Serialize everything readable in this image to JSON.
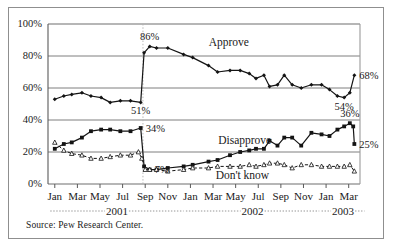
{
  "figure": {
    "source_note": "Source: Pew Research Center."
  },
  "chart_data": {
    "type": "line",
    "title": "",
    "xlabel": "",
    "ylabel": "",
    "ylim": [
      0,
      100
    ],
    "grid": true,
    "legend_position": "inline-annotations",
    "ytick_labels": [
      "0%",
      "20%",
      "40%",
      "60%",
      "80%",
      "100%"
    ],
    "ytick_values": [
      0,
      20,
      40,
      60,
      80,
      100
    ],
    "xtick_labels": [
      "Jan",
      "Mar",
      "May",
      "Jul",
      "Sep",
      "Nov",
      "Jan",
      "Mar",
      "May",
      "Jul",
      "Sep",
      "Nov",
      "Jan",
      "Mar"
    ],
    "xtick_positions": [
      0,
      2,
      4,
      6,
      8,
      10,
      12,
      14,
      16,
      18,
      20,
      22,
      24,
      26
    ],
    "year_groups": [
      {
        "label": "2001",
        "start": 0,
        "end": 11
      },
      {
        "label": "2002",
        "start": 12,
        "end": 23
      },
      {
        "label": "2003",
        "start": 24,
        "end": 27
      }
    ],
    "event_marker": {
      "label": "",
      "x": 8.4,
      "style": "dotted-vertical"
    },
    "series": [
      {
        "name": "Approve",
        "marker": "filled-diamond",
        "line_style": "solid",
        "color": "#141414",
        "points": [
          {
            "x": 0.6,
            "y": 53
          },
          {
            "x": 1.4,
            "y": 55
          },
          {
            "x": 2.1,
            "y": 56
          },
          {
            "x": 3.0,
            "y": 57
          },
          {
            "x": 3.8,
            "y": 55
          },
          {
            "x": 4.7,
            "y": 54
          },
          {
            "x": 5.5,
            "y": 51
          },
          {
            "x": 6.4,
            "y": 52
          },
          {
            "x": 7.3,
            "y": 52
          },
          {
            "x": 8.2,
            "y": 51
          },
          {
            "x": 8.5,
            "y": 82
          },
          {
            "x": 9.0,
            "y": 86
          },
          {
            "x": 9.6,
            "y": 85
          },
          {
            "x": 10.6,
            "y": 85
          },
          {
            "x": 12.0,
            "y": 81
          },
          {
            "x": 12.8,
            "y": 79
          },
          {
            "x": 14.2,
            "y": 74
          },
          {
            "x": 15.0,
            "y": 70
          },
          {
            "x": 16.1,
            "y": 71
          },
          {
            "x": 17.0,
            "y": 71
          },
          {
            "x": 17.8,
            "y": 69
          },
          {
            "x": 18.4,
            "y": 66
          },
          {
            "x": 19.1,
            "y": 68
          },
          {
            "x": 19.6,
            "y": 61
          },
          {
            "x": 20.3,
            "y": 62
          },
          {
            "x": 20.9,
            "y": 68
          },
          {
            "x": 21.6,
            "y": 62
          },
          {
            "x": 22.4,
            "y": 60
          },
          {
            "x": 23.3,
            "y": 62
          },
          {
            "x": 24.2,
            "y": 62
          },
          {
            "x": 24.9,
            "y": 59
          },
          {
            "x": 25.6,
            "y": 55
          },
          {
            "x": 26.2,
            "y": 54
          },
          {
            "x": 26.7,
            "y": 57
          },
          {
            "x": 27.1,
            "y": 68
          }
        ],
        "value_labels": [
          {
            "text": "86%",
            "x": 9.0,
            "y": 86,
            "anchor": "above"
          },
          {
            "text": "51%",
            "x": 8.2,
            "y": 51,
            "anchor": "below"
          },
          {
            "text": "54%",
            "x": 26.2,
            "y": 54,
            "anchor": "below"
          },
          {
            "text": "68%",
            "x": 27.1,
            "y": 68,
            "anchor": "right"
          }
        ]
      },
      {
        "name": "Disapprove",
        "marker": "filled-square",
        "line_style": "solid",
        "color": "#141414",
        "points": [
          {
            "x": 0.6,
            "y": 22
          },
          {
            "x": 1.4,
            "y": 25
          },
          {
            "x": 2.1,
            "y": 26
          },
          {
            "x": 3.0,
            "y": 29
          },
          {
            "x": 3.8,
            "y": 33
          },
          {
            "x": 4.7,
            "y": 34
          },
          {
            "x": 5.5,
            "y": 34
          },
          {
            "x": 6.4,
            "y": 33
          },
          {
            "x": 7.3,
            "y": 33
          },
          {
            "x": 8.2,
            "y": 35
          },
          {
            "x": 8.5,
            "y": 11
          },
          {
            "x": 9.0,
            "y": 9
          },
          {
            "x": 9.6,
            "y": 9
          },
          {
            "x": 10.6,
            "y": 10
          },
          {
            "x": 12.0,
            "y": 11
          },
          {
            "x": 12.8,
            "y": 12
          },
          {
            "x": 14.2,
            "y": 14
          },
          {
            "x": 15.0,
            "y": 15
          },
          {
            "x": 16.1,
            "y": 18
          },
          {
            "x": 17.0,
            "y": 20
          },
          {
            "x": 17.8,
            "y": 21
          },
          {
            "x": 18.4,
            "y": 22
          },
          {
            "x": 19.1,
            "y": 22
          },
          {
            "x": 19.6,
            "y": 27
          },
          {
            "x": 20.3,
            "y": 24
          },
          {
            "x": 20.9,
            "y": 29
          },
          {
            "x": 21.6,
            "y": 29
          },
          {
            "x": 22.4,
            "y": 24
          },
          {
            "x": 23.3,
            "y": 32
          },
          {
            "x": 24.2,
            "y": 31
          },
          {
            "x": 24.9,
            "y": 30
          },
          {
            "x": 25.6,
            "y": 34
          },
          {
            "x": 26.2,
            "y": 36
          },
          {
            "x": 26.7,
            "y": 38
          },
          {
            "x": 27.0,
            "y": 36
          },
          {
            "x": 27.1,
            "y": 25
          }
        ],
        "value_labels": [
          {
            "text": "34%",
            "x": 8.2,
            "y": 35,
            "anchor": "right"
          },
          {
            "text": "36%",
            "x": 26.7,
            "y": 38,
            "anchor": "above"
          },
          {
            "text": "25%",
            "x": 27.1,
            "y": 25,
            "anchor": "right"
          }
        ]
      },
      {
        "name": "Don't know",
        "marker": "open-triangle",
        "line_style": "dashed",
        "color": "#141414",
        "points": [
          {
            "x": 0.6,
            "y": 26
          },
          {
            "x": 1.4,
            "y": 21
          },
          {
            "x": 2.1,
            "y": 19
          },
          {
            "x": 3.0,
            "y": 18
          },
          {
            "x": 3.8,
            "y": 16
          },
          {
            "x": 4.7,
            "y": 16
          },
          {
            "x": 5.5,
            "y": 17
          },
          {
            "x": 6.4,
            "y": 18
          },
          {
            "x": 7.3,
            "y": 18
          },
          {
            "x": 8.0,
            "y": 20
          },
          {
            "x": 8.3,
            "y": 16
          },
          {
            "x": 8.6,
            "y": 9
          },
          {
            "x": 9.0,
            "y": 9
          },
          {
            "x": 9.6,
            "y": 9
          },
          {
            "x": 10.6,
            "y": 8
          },
          {
            "x": 12.0,
            "y": 9
          },
          {
            "x": 12.8,
            "y": 10
          },
          {
            "x": 14.2,
            "y": 10
          },
          {
            "x": 15.0,
            "y": 11
          },
          {
            "x": 16.1,
            "y": 11
          },
          {
            "x": 17.0,
            "y": 11
          },
          {
            "x": 17.8,
            "y": 12
          },
          {
            "x": 18.4,
            "y": 11
          },
          {
            "x": 19.1,
            "y": 12
          },
          {
            "x": 19.6,
            "y": 13
          },
          {
            "x": 20.3,
            "y": 13
          },
          {
            "x": 20.9,
            "y": 12
          },
          {
            "x": 21.6,
            "y": 10
          },
          {
            "x": 22.4,
            "y": 12
          },
          {
            "x": 23.3,
            "y": 12
          },
          {
            "x": 24.2,
            "y": 11
          },
          {
            "x": 24.9,
            "y": 11
          },
          {
            "x": 25.6,
            "y": 11
          },
          {
            "x": 26.2,
            "y": 11
          },
          {
            "x": 26.7,
            "y": 12
          },
          {
            "x": 27.1,
            "y": 8
          }
        ],
        "value_labels": [
          {
            "text": "7%",
            "x": 9.0,
            "y": 9,
            "anchor": "right"
          }
        ]
      }
    ],
    "series_annotations": [
      {
        "text": "Approve",
        "x": 16.0,
        "y": 86
      },
      {
        "text": "Disapprove",
        "x": 17.4,
        "y": 25
      },
      {
        "text": "Don't know",
        "x": 17.2,
        "y": 3
      }
    ]
  }
}
